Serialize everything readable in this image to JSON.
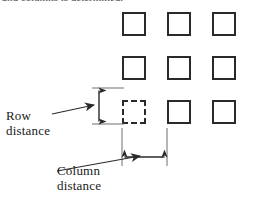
{
  "figure": {
    "name": "row-and-column-distance-diagram",
    "cut_off_caption": "and columns is determined.",
    "background_color": "#ffffff",
    "line_color": "#2a2a2a",
    "text_color": "#1a1a1a"
  },
  "annotations": {
    "row_distance": {
      "line1": "Row",
      "line2": "distance"
    },
    "column_distance": {
      "line1": "Column",
      "line2": "distance"
    }
  },
  "grid": {
    "rows": 3,
    "columns": 3,
    "square_size_px": 24,
    "column_pitch_px": 45,
    "row_pitch_px": 44,
    "origin_x_px": 122,
    "origin_y_px": 12,
    "highlighted_cell": {
      "row": 3,
      "column": 1,
      "style": "dashed"
    },
    "cells": [
      {
        "id": "cell-r1c1",
        "row": 1,
        "column": 1,
        "x": 122,
        "y": 12,
        "style": "solid"
      },
      {
        "id": "cell-r1c2",
        "row": 1,
        "column": 2,
        "x": 167,
        "y": 12,
        "style": "solid"
      },
      {
        "id": "cell-r1c3",
        "row": 1,
        "column": 3,
        "x": 212,
        "y": 12,
        "style": "solid"
      },
      {
        "id": "cell-r2c1",
        "row": 2,
        "column": 1,
        "x": 122,
        "y": 56,
        "style": "solid"
      },
      {
        "id": "cell-r2c2",
        "row": 2,
        "column": 2,
        "x": 167,
        "y": 56,
        "style": "solid"
      },
      {
        "id": "cell-r2c3",
        "row": 2,
        "column": 3,
        "x": 212,
        "y": 56,
        "style": "solid"
      },
      {
        "id": "cell-r3c1",
        "row": 3,
        "column": 1,
        "x": 122,
        "y": 100,
        "style": "dashed"
      },
      {
        "id": "cell-r3c2",
        "row": 3,
        "column": 2,
        "x": 167,
        "y": 100,
        "style": "solid"
      },
      {
        "id": "cell-r3c3",
        "row": 3,
        "column": 3,
        "x": 212,
        "y": 100,
        "style": "solid"
      }
    ]
  },
  "measurements": {
    "row_distance_arrow": {
      "orientation": "vertical",
      "x": 99,
      "y_top": 88,
      "y_bottom": 124,
      "extension_line_top_y": 88,
      "extension_line_bottom_y": 124,
      "extension_line_x_start": 92,
      "extension_line_x_end": 124
    },
    "column_distance_arrow": {
      "orientation": "horizontal",
      "y": 157,
      "x_left": 122,
      "x_right": 167,
      "extension_line_left_x": 122,
      "extension_line_right_x": 167,
      "extension_line_y_start": 128,
      "extension_line_y_end": 166
    },
    "row_leader": {
      "from_x": 52,
      "from_y": 113,
      "to_x": 96,
      "to_y": 104
    },
    "column_leader": {
      "from_x": 56,
      "from_y": 170,
      "to_x": 138,
      "to_y": 155
    }
  }
}
